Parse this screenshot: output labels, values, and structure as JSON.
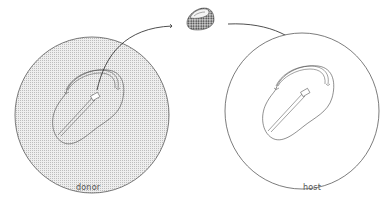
{
  "figure": {
    "type": "grafting diagram",
    "labels": {
      "donor": "donor",
      "host": "host"
    },
    "elements": {
      "donor_embryo": {
        "shaded": true,
        "description": "stippled circular field with embryo outline, primitive streak and excised node region"
      },
      "graft_piece": {
        "description": "small excised tissue fragment shown in transit"
      },
      "host_embryo": {
        "shaded": false,
        "description": "unshaded circular field with embryo outline and primitive streak"
      },
      "transfer_arrow": {
        "from": "donor",
        "to": "host",
        "via": "graft_piece"
      }
    },
    "colors": {
      "line": "#333333",
      "stipple": "#c8c8c8",
      "background": "#ffffff",
      "label": "#555555"
    }
  }
}
